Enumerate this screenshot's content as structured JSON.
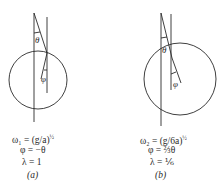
{
  "figure_a": {
    "angle_theta_label": "θ",
    "angle_phi_label": "φ",
    "omega_line": "ω₁ = (g/a)",
    "omega_exponent": "½",
    "phi_line": "φ = −θ",
    "lambda_line": "λ = 1",
    "panel_label": "(a)"
  },
  "figure_b": {
    "angle_theta_label": "θ",
    "angle_phi_label": "φ",
    "omega_line": "ω₂ = (g/6a)",
    "omega_exponent": "½",
    "phi_line": "φ = ⅔θ",
    "lambda_line": "λ = ⅙",
    "panel_label": "(b)"
  },
  "colors": {
    "line": "#2a2a2a",
    "background": "#ffffff"
  }
}
